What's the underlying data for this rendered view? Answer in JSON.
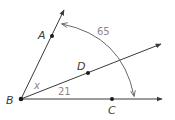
{
  "diagram": {
    "vertex": {
      "label": "B"
    },
    "points": [
      {
        "label": "A",
        "on_ray": "BA"
      },
      {
        "label": "D",
        "on_ray": "BD"
      },
      {
        "label": "C",
        "on_ray": "BC"
      }
    ],
    "rays": [
      "BA",
      "BD",
      "BC"
    ],
    "angles": [
      {
        "name": "angle-ABC",
        "label": "65",
        "between": [
          "BA",
          "BC"
        ]
      },
      {
        "name": "angle-ABD",
        "label": "x",
        "between": [
          "BA",
          "BD"
        ]
      },
      {
        "name": "angle-DBC",
        "label": "21",
        "between": [
          "BD",
          "BC"
        ]
      }
    ],
    "colors": {
      "lines": "#3a3a3a",
      "arc": "#6a6a6a",
      "measure_text": "#8a8a8a"
    }
  }
}
